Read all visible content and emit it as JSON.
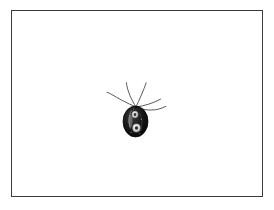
{
  "figure": {
    "kind": "scientific-illustration",
    "caption": "",
    "background_color": "#ffffff",
    "frame": {
      "border_color": "#3a3a42",
      "border_width_px": 1,
      "left": 11,
      "top": 10,
      "width": 252,
      "height": 187,
      "fill": "#ffffff"
    }
  },
  "organism": {
    "label": "",
    "body": {
      "name": "cell-body",
      "shape": "ovoid",
      "center_x": 135.5,
      "center_y": 121.5,
      "radius_x": 12.5,
      "radius_y": 15.5,
      "fill_color": "#121212",
      "outline_color": "#000000"
    },
    "apex": {
      "name": "anterior-apex",
      "x": 136,
      "y": 107
    },
    "organelles": [
      {
        "name": "contractile-vacuole",
        "cx": 135.0,
        "cy": 114.5,
        "rx": 3.2,
        "ry": 3.6,
        "fill": "#d8d8d8"
      },
      {
        "name": "nucleus",
        "cx": 136.5,
        "cy": 128.0,
        "rx": 4.0,
        "ry": 4.2,
        "fill": "#dcdcdc"
      },
      {
        "name": "nucleolus",
        "cx": 136.5,
        "cy": 128.0,
        "rx": 1.6,
        "ry": 1.7,
        "fill": "#2a2a2a"
      },
      {
        "name": "inner-vacuole-highlight",
        "cx": 135.0,
        "cy": 114.5,
        "rx": 1.3,
        "ry": 1.5,
        "fill": "#3a3a3a"
      },
      {
        "name": "cytostome-ridge",
        "cx": 130.5,
        "cy": 121.0,
        "rx": 2.0,
        "ry": 6.5,
        "fill": "#9a9a9a"
      }
    ],
    "flagella": [
      {
        "name": "flagellum-anterior-left",
        "path": "M136,107 C130,99 126,90 126,82",
        "stroke": "#4a4a4a",
        "stroke_width": 0.9
      },
      {
        "name": "flagellum-anterior-right",
        "path": "M136,107 C140,98 144,89 146,82",
        "stroke": "#4a4a4a",
        "stroke_width": 0.9
      },
      {
        "name": "flagellum-lateral-left",
        "path": "M136,107 C126,102 116,96 107,92",
        "stroke": "#4a4a4a",
        "stroke_width": 0.9
      },
      {
        "name": "flagellum-trailing-right",
        "path": "M136,107 C146,106 155,103 162,99",
        "stroke": "#4a4a4a",
        "stroke_width": 0.9
      },
      {
        "name": "flagellum-recurrent-right",
        "path": "M136,107 C147,110 156,110 166,106",
        "stroke": "#4a4a4a",
        "stroke_width": 0.9
      }
    ]
  },
  "chart_data": {
    "type": "scatter",
    "title": "",
    "xlabel": "",
    "ylabel": "",
    "annotations": []
  }
}
